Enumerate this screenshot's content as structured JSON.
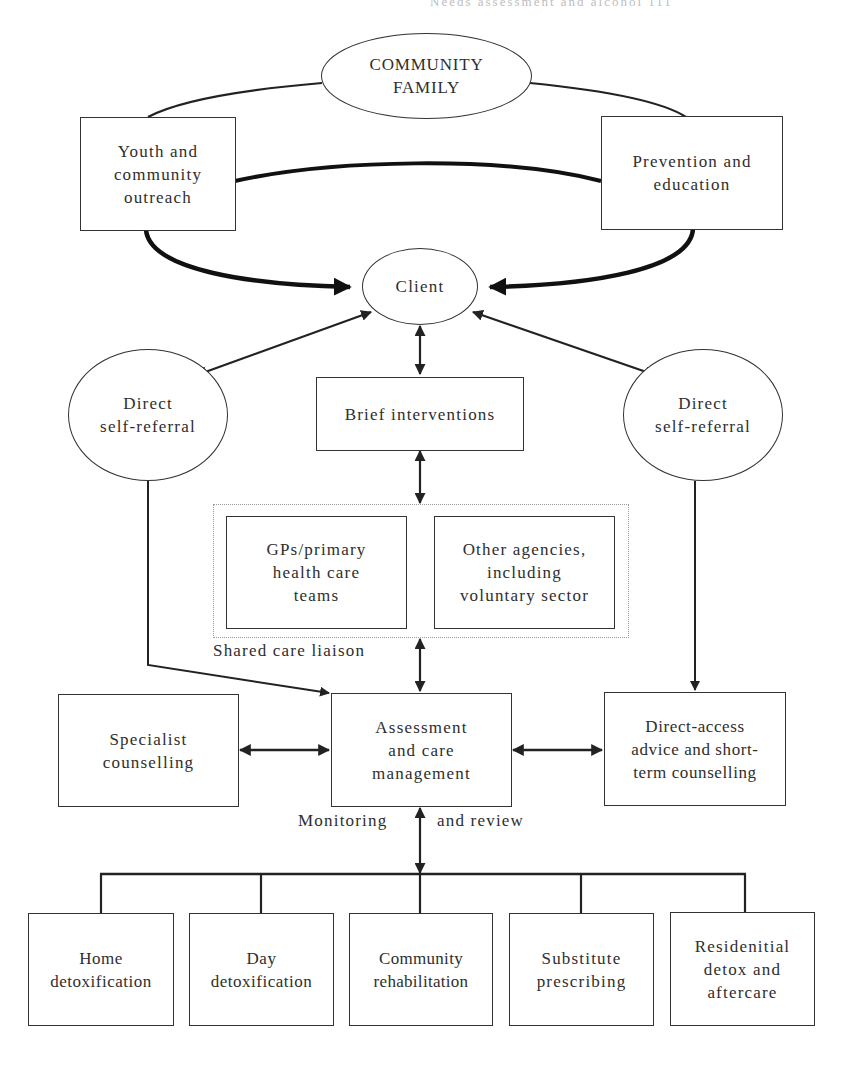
{
  "page_header": {
    "text": "Needs assessment and alcohol   111"
  },
  "diagram": {
    "top": {
      "community_family": "COMMUNITY\nFAMILY",
      "youth_outreach": "Youth and\ncommunity\noutreach",
      "prevention_education": "Prevention and\neducation",
      "client": "Client"
    },
    "middle": {
      "direct_self_referral_left": "Direct\nself-referral",
      "brief_interventions": "Brief interventions",
      "direct_self_referral_right": "Direct\nself-referral",
      "gps": "GPs/primary\nhealth care\nteams",
      "other_agencies": "Other agencies,\nincluding\nvoluntary sector",
      "shared_care_label": "Shared care liaison"
    },
    "assessment_row": {
      "specialist": "Specialist\ncounselling",
      "assessment": "Assessment\nand care\nmanagement",
      "direct_access": "Direct-access\nadvice and short-\nterm counselling",
      "monitoring_label_left": "Monitoring",
      "monitoring_label_right": "and review"
    },
    "services": [
      {
        "label": "Home\ndetoxification"
      },
      {
        "label": "Day\ndetoxification"
      },
      {
        "label": "Community\nrehabilitation"
      },
      {
        "label": "Substitute\nprescribing"
      },
      {
        "label": "Residenitial\ndetox and\naftercare"
      }
    ],
    "colors": {
      "stroke": "#222222",
      "text": "#2e2e2e",
      "container_border": "#9a9a9a"
    }
  }
}
